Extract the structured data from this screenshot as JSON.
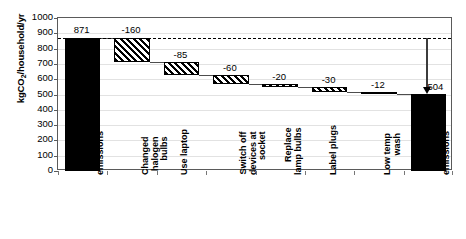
{
  "chart_data": {
    "type": "bar",
    "subtype": "waterfall",
    "title": "",
    "xlabel": "",
    "ylabel": "kgCO2/household/yr",
    "ylabel_parts": {
      "pre": "kgCO",
      "sub": "2",
      "post": "/household/yr"
    },
    "ylim": [
      0,
      1000
    ],
    "ytick_step": 100,
    "yticks": [
      "0",
      "100",
      "200",
      "300",
      "400",
      "500",
      "600",
      "700",
      "800",
      "900",
      "1000"
    ],
    "grid": true,
    "legend": "none",
    "categories": [
      "Initial emissions",
      "Changed halogen bulbs",
      "Use laptop",
      "Switch off devices at socket",
      "Replace lamp bulbs",
      "Label plugs",
      "Low temp wash",
      "Final emissions"
    ],
    "category_lines": [
      [
        "Initial",
        "emissions"
      ],
      [
        "Changed",
        "halogen",
        "bulbs"
      ],
      [
        "Use laptop"
      ],
      [
        "Switch off",
        "devices at",
        "socket"
      ],
      [
        "Replace",
        "lamp bulbs"
      ],
      [
        "Label plugs"
      ],
      [
        "Low temp",
        "wash"
      ],
      [
        "Final",
        "emissions"
      ]
    ],
    "data_labels": [
      "871",
      "-160",
      "-85",
      "-60",
      "-20",
      "-30",
      "-12",
      "504"
    ],
    "values": [
      871,
      -160,
      -85,
      -60,
      -20,
      -30,
      -12,
      504
    ],
    "bar_types": [
      "total",
      "delta",
      "delta",
      "delta",
      "delta",
      "delta",
      "delta",
      "total"
    ],
    "bar_styles": [
      "solid-black",
      "diagonal-hatch",
      "diagonal-hatch",
      "diagonal-hatch",
      "diagonal-hatch",
      "diagonal-hatch",
      "diagonal-hatch",
      "solid-black"
    ],
    "cumulative_top": [
      871,
      871,
      711,
      626,
      566,
      546,
      516,
      504
    ],
    "cumulative_bottom": [
      0,
      711,
      626,
      566,
      546,
      516,
      504,
      0
    ],
    "reference_line": {
      "value": 871,
      "style": "dashed",
      "label": ""
    },
    "annotation_arrow": {
      "from": 871,
      "to": 504,
      "label": "504",
      "direction": "down"
    }
  },
  "colors": {
    "bar_solid": "#000000",
    "bar_hatch_fg": "#000000",
    "bar_hatch_bg": "#ffffff",
    "grid": "#e2e2e2",
    "axis": "#5a5a5a",
    "text": "#000000"
  }
}
